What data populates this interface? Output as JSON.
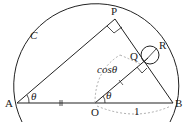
{
  "diagram": {
    "type": "geometry",
    "labels": {
      "curve": "C",
      "A": "A",
      "O": "O",
      "B": "B",
      "P": "P",
      "Q": "Q",
      "R": "R",
      "theta_A": "θ",
      "theta_O": "θ",
      "cos_label": "cosθ",
      "one_label": "1"
    },
    "colors": {
      "stroke": "#222222",
      "dashed": "#999999",
      "background": "#ffffff"
    }
  }
}
